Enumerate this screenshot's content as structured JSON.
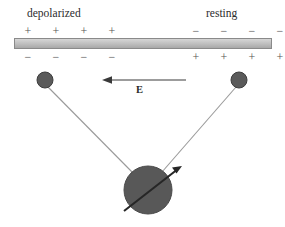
{
  "figure": {
    "width": 285,
    "height": 227,
    "background_color": "#ffffff"
  },
  "labels": {
    "depolarized": "depolarized",
    "resting": "resting",
    "field": "E"
  },
  "membrane": {
    "name": "membrane-bar",
    "x": 14,
    "y": 38,
    "width": 258,
    "height": 11,
    "fill_top": "#d6d6d6",
    "fill_bottom": "#a8a8a8",
    "stroke": "#8a8a8a"
  },
  "charges": {
    "sign_color": "#555555",
    "left_top": [
      "+",
      "+",
      "+",
      "+"
    ],
    "left_bottom": [
      "−",
      "−",
      "−",
      "−"
    ],
    "right_top": [
      "−",
      "−",
      "−",
      "−"
    ],
    "right_bottom": [
      "+",
      "+",
      "+",
      "+"
    ]
  },
  "field_arrow": {
    "name": "field-arrow",
    "direction": "left",
    "x_start": 186,
    "x_end": 104,
    "y": 80,
    "color": "#3a3a3a"
  },
  "electrodes": [
    {
      "name": "electrode-left",
      "cx": 45,
      "cy": 80,
      "r": 8,
      "fill": "#5a5a5a",
      "stroke": "#3d3d3d"
    },
    {
      "name": "electrode-right",
      "cx": 239,
      "cy": 80,
      "r": 8,
      "fill": "#5a5a5a",
      "stroke": "#3d3d3d"
    }
  ],
  "leads": [
    {
      "name": "lead-left",
      "x1": 48,
      "y1": 87,
      "x2": 134,
      "y2": 174,
      "color": "#9a9a9a"
    },
    {
      "name": "lead-right",
      "x1": 236,
      "y1": 87,
      "x2": 162,
      "y2": 172,
      "color": "#9a9a9a"
    }
  ],
  "dipole": {
    "name": "dipole-circle",
    "cx": 148,
    "cy": 190,
    "r": 24,
    "fill": "#585858",
    "stroke": "#4a4a4a",
    "moment_arrow": {
      "name": "dipole-moment-arrow",
      "x1": 124,
      "y1": 211,
      "x2": 180,
      "y2": 167,
      "color": "#262626"
    }
  }
}
